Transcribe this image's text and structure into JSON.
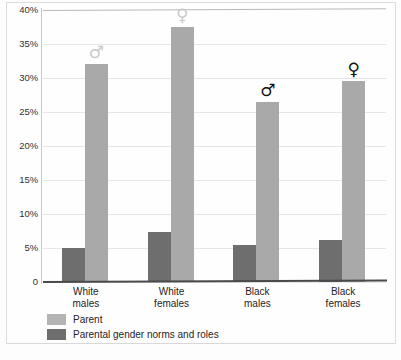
{
  "chart_data": {
    "type": "bar",
    "title": "",
    "xlabel": "",
    "ylabel": "",
    "ylim": [
      0,
      40
    ],
    "grid": true,
    "legend_position": "bottom-left",
    "categories": [
      "White males",
      "White females",
      "Black males",
      "Black females"
    ],
    "category_lines": [
      [
        "White",
        "males"
      ],
      [
        "White",
        "females"
      ],
      [
        "Black",
        "males"
      ],
      [
        "Black",
        "females"
      ]
    ],
    "ytick_labels": [
      "40%",
      "35%",
      "30%",
      "25%",
      "20%",
      "15%",
      "10%",
      "5%",
      "0"
    ],
    "ytick_values": [
      40,
      35,
      30,
      25,
      20,
      15,
      10,
      5,
      0
    ],
    "series": [
      {
        "name": "Parent",
        "color": "#a9a9a9",
        "values": [
          32.0,
          37.5,
          26.5,
          29.5
        ]
      },
      {
        "name": "Parental gender norms and roles",
        "color": "#6e6e6e",
        "values": [
          5.0,
          7.3,
          5.5,
          6.2
        ]
      }
    ],
    "annotations": [
      {
        "category": "White males",
        "symbol": "♂",
        "style": "outline",
        "name": "mars-symbol"
      },
      {
        "category": "White females",
        "symbol": "♀",
        "style": "outline",
        "name": "venus-symbol"
      },
      {
        "category": "Black males",
        "symbol": "♂",
        "style": "solid",
        "name": "mars-symbol"
      },
      {
        "category": "Black females",
        "symbol": "♀",
        "style": "solid",
        "name": "venus-symbol"
      }
    ]
  },
  "legend": {
    "items": [
      {
        "label": "Parent",
        "color": "#b4b4b4"
      },
      {
        "label": "Parental gender norms and roles",
        "color": "#6e6e6e"
      }
    ]
  }
}
